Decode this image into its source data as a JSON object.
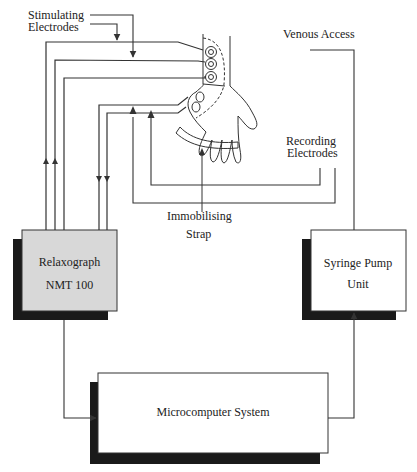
{
  "diagram": {
    "type": "block-diagram",
    "labels": {
      "stimulating_line1": "Stimulating",
      "stimulating_line2": "Electrodes",
      "venous_access": "Venous Access",
      "recording_line1": "Recording",
      "recording_line2": "Electrodes",
      "strap_line1": "Immobilising",
      "strap_line2": "Strap"
    },
    "blocks": {
      "relaxograph": {
        "line1": "Relaxograph",
        "line2": "NMT 100",
        "fill": "#d8d8d8"
      },
      "syringe_pump": {
        "line1": "Syringe Pump",
        "line2": "Unit",
        "fill": "#ffffff"
      },
      "microcomputer": {
        "line1": "Microcomputer System",
        "fill": "#ffffff"
      }
    },
    "colors": {
      "line": "#333333",
      "shadow": "#1a1a1a",
      "background": "#ffffff"
    },
    "connections": [
      {
        "from": "relaxograph",
        "to": "stimulating_electrodes",
        "count": 3
      },
      {
        "from": "recording_electrodes",
        "to": "relaxograph",
        "count": 2
      },
      {
        "from": "relaxograph",
        "to": "microcomputer"
      },
      {
        "from": "microcomputer",
        "to": "syringe_pump"
      },
      {
        "from": "syringe_pump",
        "to": "venous_access"
      }
    ]
  }
}
